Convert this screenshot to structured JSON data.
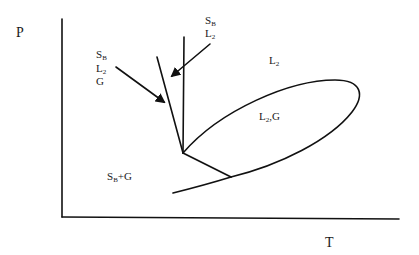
{
  "diagram": {
    "type": "phase-diagram",
    "axes": {
      "y_label": "P",
      "x_label": "T"
    },
    "region_labels": {
      "liquid": {
        "main": "L",
        "sub": "2"
      },
      "liquid_gas": {
        "main": "L",
        "sub": "2",
        "suffix": ",G"
      },
      "solid_gas": {
        "main": "S",
        "sub": "B",
        "suffix": "+G"
      }
    },
    "callouts": [
      {
        "lines": [
          {
            "main": "S",
            "sub": "B"
          },
          {
            "main": "L",
            "sub": "2"
          },
          {
            "main": "G",
            "sub": ""
          }
        ]
      },
      {
        "lines": [
          {
            "main": "S",
            "sub": "B"
          },
          {
            "main": "L",
            "sub": "2"
          }
        ]
      }
    ]
  }
}
